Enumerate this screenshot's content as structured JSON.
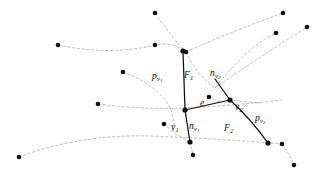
{
  "figure": {
    "background_color": "#ffffff",
    "solid_stroke_color": "#111111",
    "dashed_stroke_color": "#a9a9a9",
    "point_color": "#111111",
    "labels": [
      {
        "id": "p-v1",
        "base": "p",
        "sub": "v",
        "subsub": "1",
        "x": 152,
        "y": 72,
        "name": "label-p-v1"
      },
      {
        "id": "F1",
        "base": "F",
        "sub": "1",
        "subsub": "",
        "x": 184,
        "y": 71,
        "name": "label-F1"
      },
      {
        "id": "n-v2",
        "base": "n",
        "sub": "v",
        "subsub": "2",
        "x": 210,
        "y": 69,
        "name": "label-n-v2"
      },
      {
        "id": "e",
        "base": "e",
        "sub": "",
        "subsub": "",
        "x": 200,
        "y": 99,
        "name": "label-e"
      },
      {
        "id": "v2",
        "base": "v",
        "sub": "2",
        "subsub": "",
        "x": 235,
        "y": 103,
        "name": "label-v2"
      },
      {
        "id": "p-v2",
        "base": "p",
        "sub": "v",
        "subsub": "2",
        "x": 255,
        "y": 114,
        "name": "label-p-v2"
      },
      {
        "id": "v1",
        "base": "v",
        "sub": "1",
        "subsub": "",
        "x": 171,
        "y": 123,
        "name": "label-v1"
      },
      {
        "id": "n-v1",
        "base": "n",
        "sub": "v",
        "subsub": "1",
        "x": 189,
        "y": 122,
        "name": "label-n-v1"
      },
      {
        "id": "F2",
        "base": "F",
        "sub": "2",
        "subsub": "",
        "x": 224,
        "y": 124,
        "name": "label-F2"
      }
    ],
    "vertices": [
      {
        "id": "vtx-top",
        "x": 183,
        "y": 51,
        "r": 2.6,
        "name": "vertex-top"
      },
      {
        "id": "vtx-left",
        "x": 185,
        "y": 110,
        "r": 2.6,
        "name": "vertex-left"
      },
      {
        "id": "vtx-right",
        "x": 230,
        "y": 100,
        "r": 2.6,
        "name": "vertex-right"
      },
      {
        "id": "vtx-bottom",
        "x": 190,
        "y": 142,
        "r": 2.6,
        "name": "vertex-bottom"
      },
      {
        "id": "vtx-br",
        "x": 268,
        "y": 143,
        "r": 2.6,
        "name": "vertex-bottom-right"
      }
    ],
    "points": [
      {
        "x": 58,
        "y": 45,
        "r": 2.3,
        "name": "site-point"
      },
      {
        "x": 155,
        "y": 13,
        "r": 2.3,
        "name": "site-point"
      },
      {
        "x": 155,
        "y": 45,
        "r": 2.3,
        "name": "site-point"
      },
      {
        "x": 123,
        "y": 72,
        "r": 2.3,
        "name": "site-point"
      },
      {
        "x": 186,
        "y": 52,
        "r": 2.3,
        "name": "site-point"
      },
      {
        "x": 283,
        "y": 13,
        "r": 2.3,
        "name": "site-point"
      },
      {
        "x": 276,
        "y": 33,
        "r": 2.3,
        "name": "site-point"
      },
      {
        "x": 307,
        "y": 27,
        "r": 2.3,
        "name": "site-point"
      },
      {
        "x": 98,
        "y": 104,
        "r": 2.3,
        "name": "site-point"
      },
      {
        "x": 19,
        "y": 157,
        "r": 2.3,
        "name": "site-point"
      },
      {
        "x": 209,
        "y": 97,
        "r": 2.3,
        "name": "site-point"
      },
      {
        "x": 164,
        "y": 124,
        "r": 2.3,
        "name": "site-point"
      },
      {
        "x": 193,
        "y": 155,
        "r": 2.3,
        "name": "site-point"
      },
      {
        "x": 282,
        "y": 144,
        "r": 2.3,
        "name": "site-point"
      },
      {
        "x": 294,
        "y": 165,
        "r": 2.3,
        "name": "site-point"
      }
    ],
    "solid_edges": [
      {
        "id": "edge-top-left",
        "d": "M 183 51 L 185 110",
        "name": "solid-edge-pv1"
      },
      {
        "id": "edge-e",
        "d": "M 185 110 L 230 100",
        "name": "solid-edge-e"
      },
      {
        "id": "edge-left-bottom",
        "d": "M 185 110 L 190 142",
        "name": "solid-edge-nv1"
      },
      {
        "id": "edge-right-top",
        "d": "M 230 100 L 215 79",
        "name": "solid-edge-nv2"
      },
      {
        "id": "edge-right-down",
        "d": "M 230 100 Q 250 118 268 143",
        "name": "solid-edge-pv2"
      }
    ],
    "dashed_curves": [
      {
        "id": "dash-1",
        "d": "M 58 45 Q 110 56 155 45 Q 172 41 186 52",
        "name": "dashed-curve"
      },
      {
        "id": "dash-2",
        "d": "M 186 52 Q 235 30 283 13",
        "name": "dashed-curve"
      },
      {
        "id": "dash-3",
        "d": "M 155 13 Q 170 35 186 52",
        "name": "dashed-curve"
      },
      {
        "id": "dash-4",
        "d": "M 186 52 Q 196 74 215 88 Q 248 46 276 33",
        "name": "dashed-curve"
      },
      {
        "id": "dash-5",
        "d": "M 215 88 Q 258 58 307 27",
        "name": "dashed-curve"
      },
      {
        "id": "dash-6",
        "d": "M 123 72 Q 155 84 168 104 Q 175 116 173 132",
        "name": "dashed-curve"
      },
      {
        "id": "dash-7",
        "d": "M 98 104 Q 145 110 182 108 Q 230 106 282 100",
        "name": "dashed-curve"
      },
      {
        "id": "dash-8",
        "d": "M 19 157 Q 80 134 150 136 Q 225 139 282 144",
        "name": "dashed-curve"
      },
      {
        "id": "dash-9",
        "d": "M 209 97 Q 215 100 222 103",
        "name": "dashed-curve"
      },
      {
        "id": "dash-10",
        "d": "M 230 100 Q 245 102 260 103",
        "name": "dashed-curve"
      },
      {
        "id": "dash-11",
        "d": "M 282 144 Q 290 155 294 165",
        "name": "dashed-curve"
      },
      {
        "id": "dash-12",
        "d": "M 190 142 L 193 155",
        "name": "dashed-curve"
      },
      {
        "id": "dash-13",
        "d": "M 164 124 Q 175 134 190 142",
        "name": "dashed-curve"
      }
    ]
  }
}
